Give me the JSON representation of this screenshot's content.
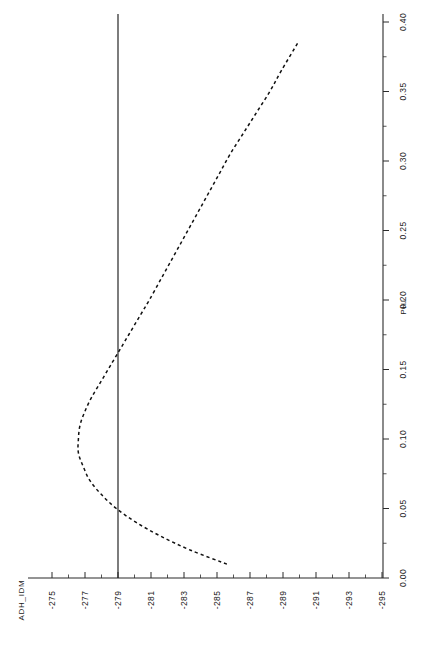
{
  "chart_data": {
    "type": "line",
    "title": "",
    "subtitle": "",
    "orientation": "rotated-landscape",
    "xlabel": "PHI",
    "ylabel": "ADH_IDM",
    "xlim": [
      0.0,
      0.4
    ],
    "ylim": [
      -295,
      -275
    ],
    "grid": false,
    "legend": null,
    "legend_position": "none",
    "linestyle": "dashed",
    "x": [
      0.01,
      0.02,
      0.03,
      0.04,
      0.05,
      0.06,
      0.07,
      0.08,
      0.09,
      0.1,
      0.11,
      0.12,
      0.13,
      0.14,
      0.15,
      0.16,
      0.17,
      0.18,
      0.19,
      0.2,
      0.215,
      0.23,
      0.245,
      0.26,
      0.275,
      0.29,
      0.305,
      0.32,
      0.335,
      0.35,
      0.365,
      0.385
    ],
    "y": [
      -285.6,
      -283.4,
      -281.6,
      -280.1,
      -278.9,
      -278.0,
      -277.3,
      -276.9,
      -276.6,
      -276.6,
      -276.7,
      -277.0,
      -277.4,
      -277.9,
      -278.4,
      -278.9,
      -279.4,
      -279.9,
      -280.4,
      -280.9,
      -281.6,
      -282.3,
      -283.0,
      -283.7,
      -284.4,
      -285.1,
      -285.8,
      -286.6,
      -287.4,
      -288.2,
      -288.9,
      -289.9
    ],
    "reference_line": {
      "axis": "ADH_IDM",
      "value": -279,
      "style": "solid",
      "orientation": "vertical-in-image"
    },
    "annotations": [],
    "value_axis": {
      "name": "ADH_IDM",
      "tick_labels": [
        "-275",
        "-277",
        "-279",
        "-281",
        "-283",
        "-285",
        "-287",
        "-289",
        "-291",
        "-293",
        "-295"
      ],
      "tick_values": [
        -275,
        -277,
        -279,
        -281,
        -283,
        -285,
        -287,
        -289,
        -291,
        -293,
        -295
      ],
      "minor_ticks_between": 1
    },
    "phi_axis": {
      "name": "PHI",
      "tick_labels": [
        "0.00",
        "0.05",
        "0.10",
        "0.15",
        "0.20",
        "0.25",
        "0.30",
        "0.35",
        "0.40"
      ],
      "tick_values": [
        0.0,
        0.05,
        0.1,
        0.15,
        0.2,
        0.25,
        0.3,
        0.35,
        0.4
      ],
      "minor_ticks_between": 1
    }
  },
  "colors": {
    "background": "#ffffff",
    "axis": "#2b2b2b",
    "curve": "#111111",
    "reference_line": "#1d1d1d",
    "text": "#1a1a1a"
  }
}
